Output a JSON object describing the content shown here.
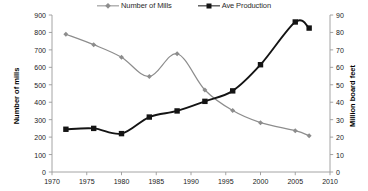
{
  "chart_data": {
    "type": "line",
    "title": "",
    "xlabel": "",
    "ylabel": "Number of mills",
    "y2label": "Million board feet",
    "xlim": [
      1970,
      2010
    ],
    "ylim": [
      0,
      900
    ],
    "y2lim": [
      0,
      90
    ],
    "grid": false,
    "legend_position": "top-center",
    "x_ticks": [
      "1970",
      "1975",
      "1980",
      "1985",
      "1990",
      "1995",
      "2000",
      "2005",
      "2010"
    ],
    "y_ticks": [
      "0",
      "100",
      "200",
      "300",
      "400",
      "500",
      "600",
      "700",
      "800",
      "900"
    ],
    "y2_ticks": [
      "0",
      "10",
      "20",
      "30",
      "40",
      "50",
      "60",
      "70",
      "80",
      "90"
    ],
    "series": [
      {
        "name": "Number of Mills",
        "axis": "left",
        "color": "#8d8d8d",
        "marker": "diamond",
        "x": [
          1972,
          1976,
          1980,
          1984,
          1988,
          1992,
          1996,
          2000,
          2005,
          2007
        ],
        "values": [
          790,
          730,
          658,
          547,
          678,
          470,
          352,
          283,
          237,
          208
        ]
      },
      {
        "name": "Ave Production",
        "axis": "right",
        "color": "#141414",
        "marker": "square",
        "x": [
          1972,
          1976,
          1980,
          1984,
          1988,
          1992,
          1996,
          2000,
          2005,
          2007
        ],
        "values": [
          24.5,
          25.0,
          22.0,
          31.5,
          35.0,
          40.5,
          46.5,
          61.5,
          86.0,
          82.5
        ]
      }
    ]
  },
  "legend": {
    "items": [
      {
        "label": "Number of Mills",
        "marker": "diamond-marker",
        "color": "#8d8d8d"
      },
      {
        "label": "Ave Production",
        "marker": "square-marker",
        "color": "#141414"
      }
    ]
  },
  "axes": {
    "y_left_title": "Number of mills",
    "y_right_title": "Million board feet"
  }
}
